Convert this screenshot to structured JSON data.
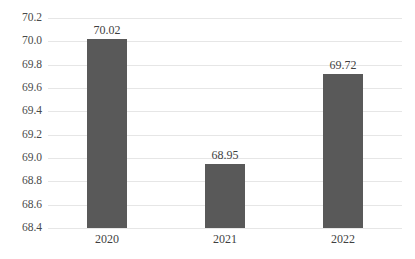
{
  "chart_data": {
    "type": "bar",
    "title": "",
    "subtitle": "",
    "xlabel": "",
    "ylabel": "",
    "categories": [
      "2020",
      "2021",
      "2022"
    ],
    "values": [
      70.02,
      68.95,
      69.72
    ],
    "value_labels": [
      "70.02",
      "68.95",
      "69.72"
    ],
    "ylim": [
      68.4,
      70.2
    ],
    "ytick_step": 0.2,
    "ytick_labels": [
      "70.2",
      "70.0",
      "69.8",
      "69.6",
      "69.4",
      "69.2",
      "69.0",
      "68.8",
      "68.6",
      "68.4"
    ],
    "ytick_values": [
      70.2,
      70.0,
      69.8,
      69.6,
      69.4,
      69.2,
      69.0,
      68.8,
      68.6,
      68.4
    ],
    "grid": true,
    "grid_orientation": "horizontal",
    "legend": false,
    "legend_position": "none",
    "bar_color": "#595959",
    "grid_color": "#e6e6e6",
    "background_color": "#ffffff",
    "label_color": "#3f3f3f"
  }
}
